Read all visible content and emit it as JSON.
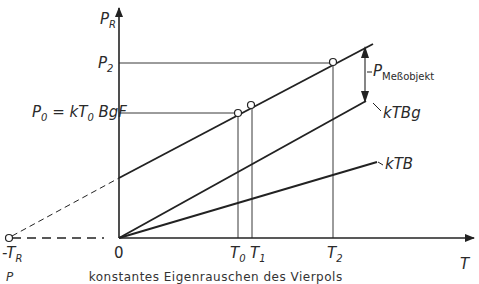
{
  "diagram": {
    "y_axis": {
      "symbol": "P",
      "sub": "R"
    },
    "x_axis": {
      "symbol": "T"
    },
    "y_labels": {
      "p2": {
        "symbol": "P",
        "sub": "2"
      },
      "p0": {
        "symbol": "P",
        "sub": "0",
        "rest": " = kT",
        "sub2": "0",
        "rest2": " BgF"
      }
    },
    "x_labels": {
      "neg_tr": {
        "symbol": "-T",
        "sub": "R"
      },
      "origin": "0",
      "t0": {
        "symbol": "T",
        "sub": "0"
      },
      "t1": {
        "symbol": "T",
        "sub": "1"
      },
      "t2": {
        "symbol": "T",
        "sub": "2"
      }
    },
    "line_labels": {
      "messobjekt": {
        "symbol": "P",
        "sub": "Meßobjekt"
      },
      "ktbg": "kTBg",
      "ktb": "kTB"
    },
    "caption": {
      "symbol": "P",
      "text": "konstantes Eigenrauschen des Vierpols"
    }
  }
}
